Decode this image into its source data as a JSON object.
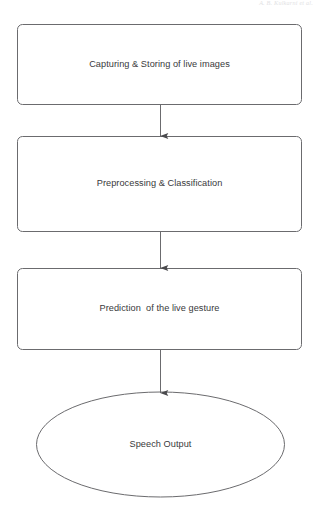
{
  "page": {
    "header_text": "A. B. Kulkarni et al.",
    "background_color": "#ffffff",
    "stroke_color": "#6b6b6e",
    "text_color": "#39393b"
  },
  "diagram": {
    "orientation": "vertical-top-to-bottom",
    "nodes": [
      {
        "id": "capture",
        "shape": "rounded-rectangle",
        "label": "Capturing & Storing of live images"
      },
      {
        "id": "preprocess",
        "shape": "rounded-rectangle",
        "label": "Preprocessing & Classification"
      },
      {
        "id": "predict",
        "shape": "rounded-rectangle",
        "label": "Prediction  of the live gesture"
      },
      {
        "id": "speech",
        "shape": "ellipse",
        "label": "Speech Output"
      }
    ],
    "connectors": [
      {
        "id": "capture-to-preprocess",
        "from": "capture",
        "to": "preprocess",
        "style": "arrow-down"
      },
      {
        "id": "preprocess-to-predict",
        "from": "preprocess",
        "to": "predict",
        "style": "arrow-down"
      },
      {
        "id": "predict-to-speech",
        "from": "predict",
        "to": "speech",
        "style": "arrow-down"
      }
    ]
  }
}
